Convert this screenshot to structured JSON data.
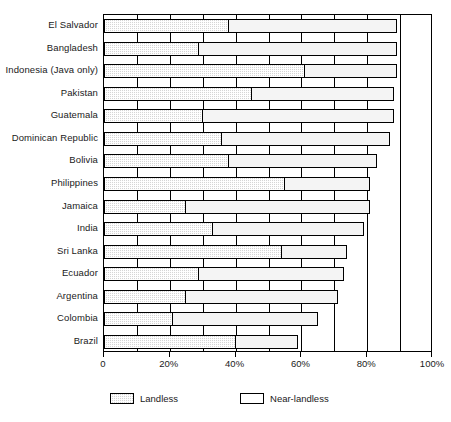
{
  "chart_data": {
    "type": "bar",
    "orientation": "horizontal",
    "stacked": true,
    "title": "",
    "subtitle": "",
    "xlabel": "",
    "ylabel": "",
    "xlim": [
      0,
      100
    ],
    "xticks": [
      0,
      20,
      40,
      60,
      80,
      100
    ],
    "xticklabels": [
      "0",
      "20%",
      "40%",
      "60%",
      "80%",
      "100%"
    ],
    "grid": "vertical gridlines every 10%",
    "legend_position": "below-left",
    "categories": [
      "El Salvador",
      "Bangladesh",
      "Indonesia (Java only)",
      "Pakistan",
      "Guatemala",
      "Dominican Republic",
      "Bolivia",
      "Philippines",
      "Jamaica",
      "India",
      "Sri Lanka",
      "Ecuador",
      "Argentina",
      "Colombia",
      "Brazil"
    ],
    "series": [
      {
        "name": "Landless",
        "color": "#d5d5d5",
        "fill": "checkered-hatch",
        "values": [
          38,
          29,
          61,
          45,
          30,
          36,
          38,
          55,
          25,
          33,
          54,
          29,
          25,
          21,
          40
        ]
      },
      {
        "name": "Near-landless",
        "color": "#ffffff",
        "fill": "solid-white",
        "values": [
          51,
          60,
          28,
          43,
          58,
          51,
          45,
          26,
          56,
          46,
          20,
          44,
          46,
          44,
          19
        ]
      }
    ],
    "totals": [
      89,
      89,
      89,
      88,
      88,
      87,
      83,
      81,
      81,
      79,
      74,
      73,
      71,
      65,
      59
    ]
  },
  "legend": {
    "items": [
      {
        "label": "Landless",
        "swatch": "hatched"
      },
      {
        "label": "Near-landless",
        "swatch": "white"
      }
    ]
  },
  "colors": {
    "axis": "#000000",
    "landless": "#d5d5d5",
    "near_landless": "#ffffff",
    "background": "#ffffff"
  }
}
